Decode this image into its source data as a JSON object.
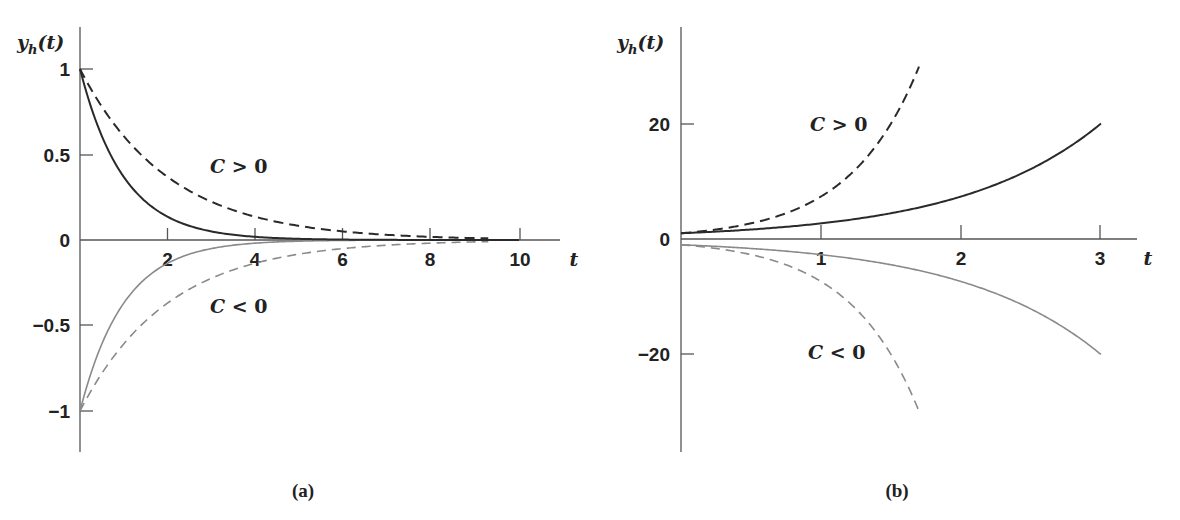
{
  "chart_data": [
    {
      "type": "line",
      "panel": "(a)",
      "title": "",
      "xlabel": "t",
      "ylabel": "y_h(t)",
      "xlim": [
        0,
        10.5
      ],
      "ylim": [
        -1.25,
        1.2
      ],
      "x_ticks": [
        2,
        4,
        6,
        8,
        10
      ],
      "y_ticks": [
        1,
        0.5,
        0,
        -0.5,
        -1
      ],
      "y_tick_labels": [
        "1",
        "0.5",
        "0",
        "−0.5",
        "−1"
      ],
      "grid": false,
      "series": [
        {
          "name": "C>0 solid",
          "style": "solid",
          "color": "#222222",
          "formula": "exp(-t)",
          "x": [
            0,
            1,
            2,
            3,
            4,
            6,
            8,
            10
          ],
          "values": [
            1,
            0.37,
            0.14,
            0.05,
            0.02,
            0.0,
            0.0,
            0.0
          ]
        },
        {
          "name": "C>0 dashed",
          "style": "dashed",
          "color": "#222222",
          "formula": "exp(-t/2)",
          "x": [
            0,
            1,
            2,
            4,
            6,
            8,
            9.3
          ],
          "values": [
            1,
            0.61,
            0.37,
            0.14,
            0.05,
            0.02,
            0.01
          ]
        },
        {
          "name": "C<0 solid",
          "style": "solid",
          "color": "#888888",
          "formula": "-exp(-t)",
          "x": [
            0,
            1,
            2,
            3,
            4,
            6,
            8,
            10
          ],
          "values": [
            -1,
            -0.37,
            -0.14,
            -0.05,
            -0.02,
            0.0,
            0.0,
            0.0
          ]
        },
        {
          "name": "C<0 dashed",
          "style": "dashed",
          "color": "#888888",
          "formula": "-exp(-t/2)",
          "x": [
            0,
            1,
            2,
            4,
            6,
            8,
            9.3
          ],
          "values": [
            -1,
            -0.61,
            -0.37,
            -0.14,
            -0.05,
            -0.02,
            -0.01
          ]
        }
      ],
      "annotations": [
        "C > 0",
        "C < 0"
      ],
      "caption": "(a)"
    },
    {
      "type": "line",
      "panel": "(b)",
      "title": "",
      "xlabel": "t",
      "ylabel": "y_h(t)",
      "xlim": [
        0,
        3.3
      ],
      "ylim": [
        -37,
        37
      ],
      "x_ticks": [
        1,
        2,
        3
      ],
      "y_ticks": [
        20,
        0,
        -20
      ],
      "y_tick_labels": [
        "20",
        "0",
        "−20"
      ],
      "grid": false,
      "series": [
        {
          "name": "C>0 solid",
          "style": "solid",
          "color": "#222222",
          "formula": "exp(t)",
          "x": [
            0,
            1,
            2,
            3
          ],
          "values": [
            1,
            2.7,
            7.4,
            20.1
          ]
        },
        {
          "name": "C>0 dashed",
          "style": "dashed",
          "color": "#222222",
          "formula": "exp(2t)",
          "x": [
            0,
            0.5,
            1,
            1.5,
            1.7
          ],
          "values": [
            1,
            2.7,
            7.4,
            20.1,
            30
          ]
        },
        {
          "name": "C<0 solid",
          "style": "solid",
          "color": "#888888",
          "formula": "-exp(t)",
          "x": [
            0,
            1,
            2,
            3
          ],
          "values": [
            -1,
            -2.7,
            -7.4,
            -20.1
          ]
        },
        {
          "name": "C<0 dashed",
          "style": "dashed",
          "color": "#888888",
          "formula": "-exp(2t)",
          "x": [
            0,
            0.5,
            1,
            1.5,
            1.7
          ],
          "values": [
            -1,
            -2.7,
            -7.4,
            -20.1,
            -30
          ]
        }
      ],
      "annotations": [
        "C > 0",
        "C < 0"
      ],
      "caption": "(b)"
    }
  ],
  "labels": {
    "a": {
      "ylabel": "y",
      "ylabel_sub": "h",
      "ylabel_arg": "(t)",
      "xvar": "t",
      "yticks": [
        "1",
        "0.5",
        "0",
        "−0.5",
        "−1"
      ],
      "xticks": [
        "2",
        "4",
        "6",
        "8",
        "10"
      ],
      "ann_pos": "C > 0",
      "ann_neg": "C < 0",
      "caption": "(a)"
    },
    "b": {
      "ylabel": "y",
      "ylabel_sub": "h",
      "ylabel_arg": "(t)",
      "xvar": "t",
      "yticks": [
        "20",
        "0",
        "−20"
      ],
      "xticks": [
        "1",
        "2",
        "3"
      ],
      "ann_pos": "C > 0",
      "ann_neg": "C < 0",
      "caption": "(b)"
    }
  }
}
